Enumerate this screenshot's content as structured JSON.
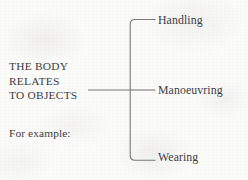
{
  "diagram": {
    "type": "bracket-diagram",
    "orientation": "left-stem-to-right-branches",
    "stem": {
      "lines": [
        "THE BODY",
        "RELATES",
        "TO OBJECTS"
      ],
      "note": "For example:"
    },
    "branches": [
      {
        "label": "Handling"
      },
      {
        "label": "Manoeuvring"
      },
      {
        "label": "Wearing"
      }
    ],
    "colors": {
      "ink": "#3d3d3f",
      "rule": "#7a7a7c",
      "paper": "#fbfbfa"
    }
  }
}
